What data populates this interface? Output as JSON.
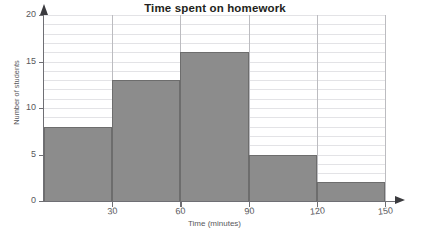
{
  "chart_data": {
    "type": "bar",
    "title": "Time spent on homework",
    "xlabel": "Time (minutes)",
    "ylabel": "Number of students",
    "categories": [
      "0–30",
      "30–60",
      "60–90",
      "90–120",
      "120–150"
    ],
    "bin_edges": [
      0,
      30,
      60,
      90,
      120,
      150
    ],
    "values": [
      8,
      13,
      16,
      5,
      2
    ],
    "xlim": [
      0,
      150
    ],
    "ylim": [
      0,
      20
    ],
    "x_ticks": [
      30,
      60,
      90,
      120,
      150
    ],
    "x_tick_labels": [
      "30",
      "60",
      "90",
      "120",
      "150"
    ],
    "y_ticks": [
      0,
      5,
      10,
      15,
      20
    ],
    "y_tick_labels": [
      "0",
      "5",
      "10",
      "15",
      "20"
    ],
    "y_minor_step": 1,
    "grid": "horizontal minor gridlines every 1 student; vertical gridlines at each bin edge",
    "legend": "none",
    "bar_color": "#8c8c8c",
    "bar_edge_color": "#6d6d6d",
    "grid_color": "#e3e3e6",
    "vgrid_color": "#bcbcc0",
    "axis_color": "#6f6f74",
    "title_color": "#231f20",
    "label_color": "#58585c",
    "background": "#ffffff",
    "axis_arrows": true
  }
}
